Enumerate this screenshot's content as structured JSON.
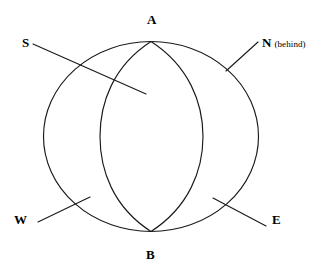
{
  "figure": {
    "background_color": "#ffffff",
    "stroke_color": "#1a1a1a",
    "width": 330,
    "height": 280
  },
  "geometry": {
    "outer_ellipse": {
      "cx": 151,
      "cy": 136.5,
      "rx": 107.5,
      "ry": 95
    },
    "lens_left_arc": {
      "from": "A",
      "to": "B",
      "mid_x": 100
    },
    "lens_right_arc": {
      "from": "A",
      "to": "B",
      "mid_x": 203
    },
    "apex_top": {
      "x": 151,
      "y": 41.5
    },
    "apex_bottom": {
      "x": 151,
      "y": 231.5
    }
  },
  "vertex_labels": [
    {
      "id": "A",
      "text": "A",
      "x": 147,
      "y": 13
    },
    {
      "id": "B",
      "text": "B",
      "x": 146,
      "y": 248
    }
  ],
  "compass_labels": [
    {
      "id": "S",
      "text": "S",
      "qualifier": "",
      "x": 22,
      "y": 36
    },
    {
      "id": "N",
      "text": "N",
      "qualifier": "(behind)",
      "x": 262,
      "y": 36
    },
    {
      "id": "W",
      "text": "W",
      "qualifier": "",
      "x": 14,
      "y": 213
    },
    {
      "id": "E",
      "text": "E",
      "qualifier": "",
      "x": 272,
      "y": 213
    }
  ],
  "leader_lines": [
    {
      "id": "S-leader",
      "x1": 33,
      "y1": 44,
      "x2": 146,
      "y2": 94
    },
    {
      "id": "N-leader",
      "x1": 258,
      "y1": 42,
      "x2": 226,
      "y2": 71
    },
    {
      "id": "W-leader",
      "x1": 38,
      "y1": 222,
      "x2": 90,
      "y2": 197
    },
    {
      "id": "E-leader",
      "x1": 213,
      "y1": 198,
      "x2": 266,
      "y2": 226
    }
  ]
}
